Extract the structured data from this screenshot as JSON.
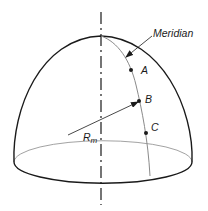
{
  "diagram": {
    "labels": {
      "meridian": "Meridian",
      "point_a": "A",
      "point_b": "B",
      "point_c": "C",
      "radius_main": "R",
      "radius_sub": "m"
    },
    "colors": {
      "outline": "#1a1a1a",
      "thin_line": "#8a8a8a",
      "background": "#ffffff"
    }
  }
}
